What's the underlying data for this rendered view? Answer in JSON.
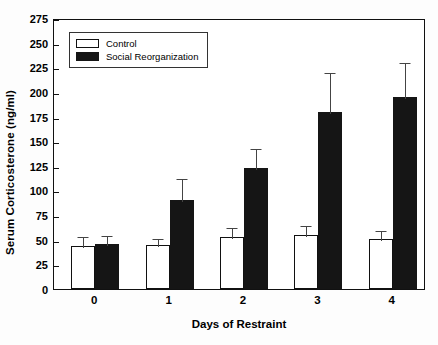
{
  "chart_data": {
    "type": "bar",
    "title": "",
    "xlabel": "Days of Restraint",
    "ylabel": "Serum Corticosterone (ng/ml)",
    "categories": [
      "0",
      "1",
      "2",
      "3",
      "4"
    ],
    "ylim": [
      0,
      275
    ],
    "ytick_step": 25,
    "yticks": [
      "0",
      "25",
      "50",
      "75",
      "100",
      "125",
      "150",
      "175",
      "200",
      "225",
      "250",
      "275"
    ],
    "grid": false,
    "legend_position": "upper-left inside plot",
    "series": [
      {
        "name": "Control",
        "color": "#ffffff",
        "edge_color": "#111111",
        "values": [
          44,
          45,
          53,
          55,
          51
        ],
        "errors": [
          11,
          8,
          11,
          11,
          10
        ]
      },
      {
        "name": "Social Reorganization",
        "color": "#151515",
        "edge_color": "#151515",
        "values": [
          46,
          90,
          123,
          180,
          195
        ],
        "errors": [
          10,
          24,
          21,
          41,
          36
        ]
      }
    ]
  },
  "legend": {
    "items": [
      {
        "label": "Control",
        "swatch": "open-square-swatch"
      },
      {
        "label": "Social Reorganization",
        "swatch": "filled-square-swatch"
      }
    ]
  }
}
